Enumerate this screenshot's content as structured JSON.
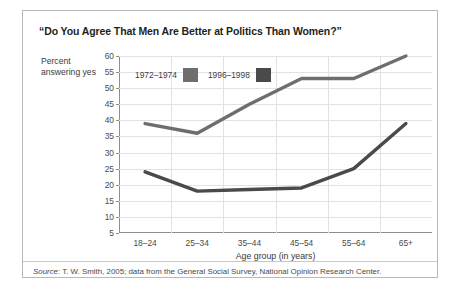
{
  "figure": {
    "title": "“Do You Agree That Men Are Better at Politics Than Women?”",
    "ylabel_text": "Percent answering yes",
    "source_prefix": "Source:",
    "source_text": " T. W. Smith, 2005; data from the General Social Survey, National Opinion Research Center."
  },
  "chart_data": {
    "type": "line",
    "title": "“Do You Agree That Men Are Better at Politics Than Women?”",
    "xlabel": "Age group (in years)",
    "ylabel": "Percent answering yes",
    "categories": [
      "18–24",
      "25–34",
      "35–44",
      "45–54",
      "55–64",
      "65+"
    ],
    "ylim": [
      5,
      60
    ],
    "yticks": [
      5,
      10,
      15,
      20,
      25,
      30,
      35,
      40,
      45,
      50,
      55,
      60
    ],
    "grid": true,
    "legend_position": "inside-top-left",
    "series": [
      {
        "name": "1972–1974",
        "color": "#6e6e6e",
        "values": [
          39,
          36,
          45,
          53,
          53,
          60
        ]
      },
      {
        "name": "1996–1998",
        "color": "#4a4a4a",
        "values": [
          24,
          18,
          18.5,
          19,
          25,
          39
        ]
      }
    ]
  }
}
